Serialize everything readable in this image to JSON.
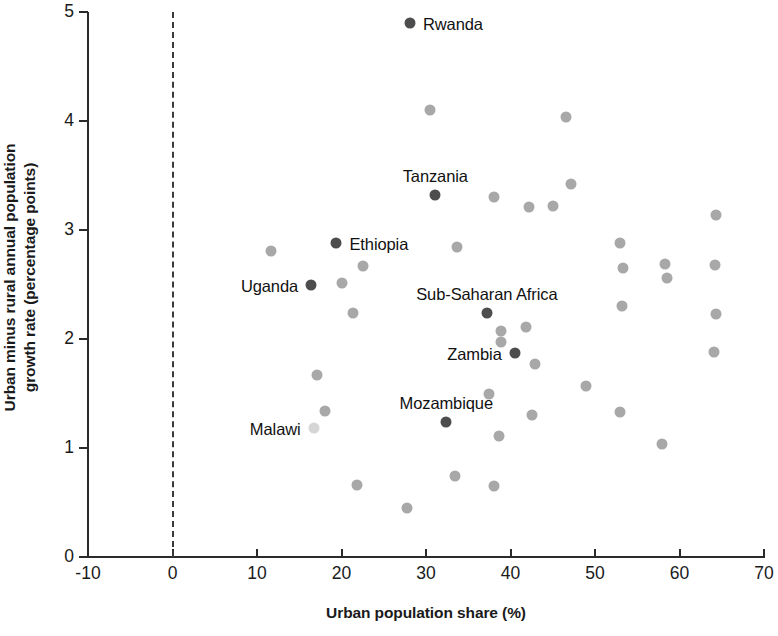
{
  "chart_data": {
    "type": "scatter",
    "title": "",
    "xlabel": "Urban population share (%)",
    "ylabel": "Urban minus rural annual population growth rate (percentage points)",
    "ylabel_line1": "Urban minus rural annual population",
    "ylabel_line2": "growth rate (percentage points)",
    "xlim": [
      -10,
      70
    ],
    "ylim": [
      0,
      5
    ],
    "xticks": [
      "-10",
      "0",
      "10",
      "20",
      "30",
      "40",
      "50",
      "60",
      "70"
    ],
    "xtick_values": [
      -10,
      0,
      10,
      20,
      30,
      40,
      50,
      60,
      70
    ],
    "yticks": [
      "0",
      "1",
      "2",
      "3",
      "4",
      "5"
    ],
    "ytick_values": [
      0,
      1,
      2,
      3,
      4,
      5
    ],
    "grid": false,
    "legend": "none",
    "reference_line": {
      "type": "vertical-dashed",
      "x": 0
    },
    "colors": {
      "highlight": "#4d4d4d",
      "normal": "#a8a8a8",
      "faint": "#d6d6d6",
      "axis": "#2b2b2b",
      "text": "#111111"
    },
    "points": [
      {
        "label": "Rwanda",
        "x": 28.1,
        "y": 4.9,
        "style": "highlight",
        "label_pos": "right"
      },
      {
        "label": "Tanzania",
        "x": 31.1,
        "y": 3.32,
        "style": "highlight",
        "label_pos": "above"
      },
      {
        "label": "Ethiopia",
        "x": 19.4,
        "y": 2.88,
        "style": "highlight",
        "label_pos": "right"
      },
      {
        "label": "Uganda",
        "x": 16.4,
        "y": 2.5,
        "style": "highlight",
        "label_pos": "left"
      },
      {
        "label": "Sub-Saharan Africa",
        "x": 37.2,
        "y": 2.24,
        "style": "highlight",
        "label_pos": "above"
      },
      {
        "label": "Zambia",
        "x": 40.5,
        "y": 1.87,
        "style": "highlight",
        "label_pos": "left"
      },
      {
        "label": "Mozambique",
        "x": 32.4,
        "y": 1.24,
        "style": "highlight",
        "label_pos": "above"
      },
      {
        "label": "Malawi",
        "x": 16.7,
        "y": 1.18,
        "style": "faint",
        "label_pos": "left"
      },
      {
        "label": "",
        "x": 30.5,
        "y": 4.1,
        "style": "normal"
      },
      {
        "label": "",
        "x": 46.6,
        "y": 4.04,
        "style": "normal"
      },
      {
        "label": "",
        "x": 47.2,
        "y": 3.42,
        "style": "normal"
      },
      {
        "label": "",
        "x": 38.1,
        "y": 3.3,
        "style": "normal"
      },
      {
        "label": "",
        "x": 42.2,
        "y": 3.21,
        "style": "normal"
      },
      {
        "label": "",
        "x": 45.0,
        "y": 3.22,
        "style": "normal"
      },
      {
        "label": "",
        "x": 64.3,
        "y": 3.14,
        "style": "normal"
      },
      {
        "label": "",
        "x": 11.6,
        "y": 2.81,
        "style": "normal"
      },
      {
        "label": "",
        "x": 33.7,
        "y": 2.84,
        "style": "normal"
      },
      {
        "label": "",
        "x": 53.0,
        "y": 2.88,
        "style": "normal"
      },
      {
        "label": "",
        "x": 22.6,
        "y": 2.67,
        "style": "normal"
      },
      {
        "label": "",
        "x": 53.3,
        "y": 2.65,
        "style": "normal"
      },
      {
        "label": "",
        "x": 58.3,
        "y": 2.69,
        "style": "normal"
      },
      {
        "label": "",
        "x": 64.2,
        "y": 2.68,
        "style": "normal"
      },
      {
        "label": "",
        "x": 20.0,
        "y": 2.51,
        "style": "normal"
      },
      {
        "label": "",
        "x": 58.5,
        "y": 2.56,
        "style": "normal"
      },
      {
        "label": "",
        "x": 53.2,
        "y": 2.3,
        "style": "normal"
      },
      {
        "label": "",
        "x": 21.4,
        "y": 2.24,
        "style": "normal"
      },
      {
        "label": "",
        "x": 64.3,
        "y": 2.23,
        "style": "normal"
      },
      {
        "label": "",
        "x": 38.9,
        "y": 2.07,
        "style": "normal"
      },
      {
        "label": "",
        "x": 41.8,
        "y": 2.11,
        "style": "normal"
      },
      {
        "label": "",
        "x": 38.9,
        "y": 1.97,
        "style": "normal"
      },
      {
        "label": "",
        "x": 64.1,
        "y": 1.88,
        "style": "normal"
      },
      {
        "label": "",
        "x": 42.9,
        "y": 1.77,
        "style": "normal"
      },
      {
        "label": "",
        "x": 17.1,
        "y": 1.67,
        "style": "normal"
      },
      {
        "label": "",
        "x": 48.9,
        "y": 1.57,
        "style": "normal"
      },
      {
        "label": "",
        "x": 37.5,
        "y": 1.5,
        "style": "normal"
      },
      {
        "label": "",
        "x": 18.0,
        "y": 1.34,
        "style": "normal"
      },
      {
        "label": "",
        "x": 42.5,
        "y": 1.3,
        "style": "normal"
      },
      {
        "label": "",
        "x": 52.9,
        "y": 1.33,
        "style": "normal"
      },
      {
        "label": "",
        "x": 38.6,
        "y": 1.11,
        "style": "normal"
      },
      {
        "label": "",
        "x": 57.9,
        "y": 1.04,
        "style": "normal"
      },
      {
        "label": "",
        "x": 33.4,
        "y": 0.74,
        "style": "normal"
      },
      {
        "label": "",
        "x": 21.8,
        "y": 0.66,
        "style": "normal"
      },
      {
        "label": "",
        "x": 38.1,
        "y": 0.65,
        "style": "normal"
      },
      {
        "label": "",
        "x": 27.8,
        "y": 0.45,
        "style": "normal"
      }
    ]
  }
}
